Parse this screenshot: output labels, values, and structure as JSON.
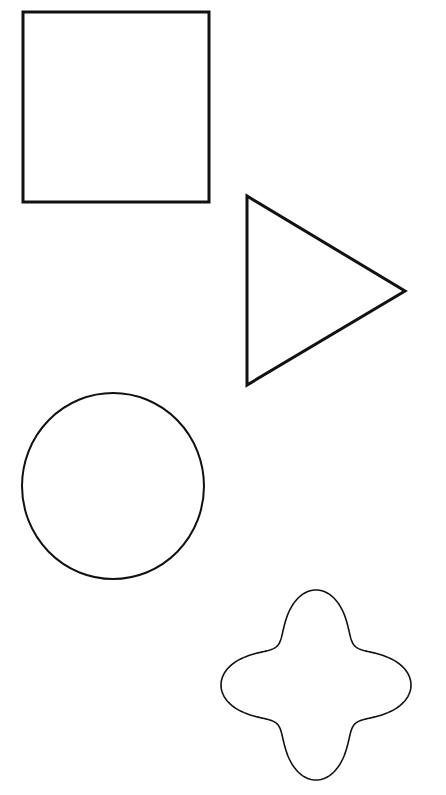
{
  "canvas": {
    "width": 446,
    "height": 795,
    "background": "#ffffff"
  },
  "shapes": [
    {
      "name": "square",
      "type": "rect",
      "x": 23,
      "y": 12,
      "width": 186,
      "height": 190,
      "stroke": "#111111",
      "stroke_width": 3
    },
    {
      "name": "triangle",
      "type": "polygon",
      "points": [
        [
          247,
          196
        ],
        [
          247,
          385
        ],
        [
          405,
          291
        ]
      ],
      "stroke": "#111111",
      "stroke_width": 3
    },
    {
      "name": "circle",
      "type": "ellipse",
      "cx": 113,
      "cy": 486,
      "rx": 91,
      "ry": 93,
      "stroke": "#111111",
      "stroke_width": 2
    },
    {
      "name": "quatrefoil",
      "type": "path",
      "cx": 316,
      "cy": 685,
      "stroke": "#111111",
      "stroke_width": 1.6
    }
  ]
}
